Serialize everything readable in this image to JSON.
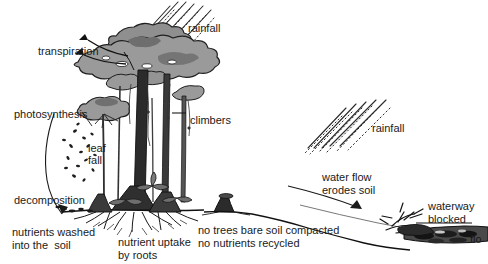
{
  "diagram": {
    "colors": {
      "ink": "#1a1a1a",
      "canopy_fill": "#9a9a9a",
      "canopy_dark": "#6e6e6e",
      "trunk_dark": "#2b2b2b",
      "soil": "#111111",
      "water": "#4d4d4d",
      "background": "#ffffff"
    },
    "labels": [
      {
        "id": "transpiration",
        "text": "transpiration",
        "x": 38,
        "y": 45,
        "align": "left"
      },
      {
        "id": "rainfall-forest",
        "text": "rainfall",
        "x": 188,
        "y": 22,
        "align": "left"
      },
      {
        "id": "photosynthesis",
        "text": "photosynthesis",
        "x": 14,
        "y": 108,
        "align": "left"
      },
      {
        "id": "climbers",
        "text": "climbers",
        "x": 190,
        "y": 114,
        "align": "left"
      },
      {
        "id": "leaf-fall-line1",
        "text": "leaf",
        "x": 88,
        "y": 142,
        "align": "left"
      },
      {
        "id": "leaf-fall-line2",
        "text": "fall",
        "x": 88,
        "y": 154,
        "align": "left"
      },
      {
        "id": "decomposition",
        "text": "decomposition",
        "x": 14,
        "y": 194,
        "align": "left"
      },
      {
        "id": "nutrients-washed-1",
        "text": "nutrients washed",
        "x": 12,
        "y": 226,
        "align": "left"
      },
      {
        "id": "nutrients-washed-2",
        "text": "into the  soil",
        "x": 12,
        "y": 239,
        "align": "left"
      },
      {
        "id": "nutrient-uptake-1",
        "text": "nutrient uptake",
        "x": 118,
        "y": 236,
        "align": "left"
      },
      {
        "id": "nutrient-uptake-2",
        "text": "by roots",
        "x": 118,
        "y": 249,
        "align": "left"
      },
      {
        "id": "no-trees-1",
        "text": "no trees bare soil compacted",
        "x": 198,
        "y": 224,
        "align": "left"
      },
      {
        "id": "no-trees-2",
        "text": "no nutrients recycled",
        "x": 198,
        "y": 237,
        "align": "left"
      },
      {
        "id": "rainfall-deforested",
        "text": "rainfall",
        "x": 372,
        "y": 122,
        "align": "left"
      },
      {
        "id": "water-flow-1",
        "text": "water flow",
        "x": 322,
        "y": 171,
        "align": "left"
      },
      {
        "id": "water-flow-2",
        "text": "erodes soil",
        "x": 322,
        "y": 184,
        "align": "left"
      },
      {
        "id": "waterway-1",
        "text": "waterway",
        "x": 428,
        "y": 200,
        "align": "left"
      },
      {
        "id": "waterway-2",
        "text": "blocked",
        "x": 428,
        "y": 213,
        "align": "left"
      },
      {
        "id": "flooding-cut",
        "text": "flo",
        "x": 470,
        "y": 233,
        "align": "left"
      }
    ],
    "regions": {
      "left_scene": "intact rainforest with canopy, climbers, understory, buttress roots",
      "right_scene": "deforested slope with stump, eroding soil and blocked waterway"
    }
  }
}
